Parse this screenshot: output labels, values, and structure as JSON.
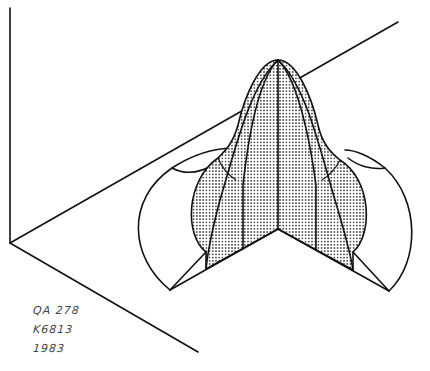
{
  "figure": {
    "colors": {
      "line": "#111111",
      "stipple": "#222222",
      "background": "#ffffff"
    }
  },
  "annotations": {
    "call_number_line1": "QA 278",
    "call_number_line2": "K6813",
    "year": "1983"
  }
}
